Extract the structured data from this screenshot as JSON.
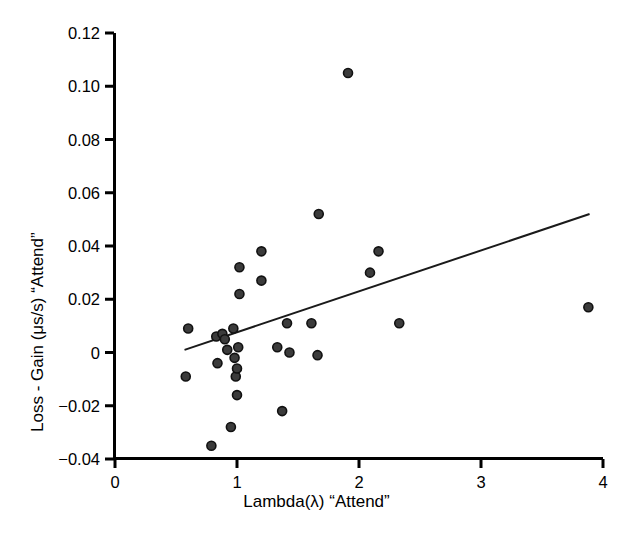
{
  "chart_data": {
    "type": "scatter",
    "title": "",
    "xlabel": "Lambda(λ) “Attend”",
    "ylabel": "Loss - Gain (μs/s) “Attend”",
    "xlim": [
      0,
      4
    ],
    "ylim": [
      -0.04,
      0.12
    ],
    "xticks": [
      0,
      1,
      2,
      3,
      4
    ],
    "xticklabels": [
      "0",
      "1",
      "2",
      "3",
      "4"
    ],
    "yticks": [
      -0.04,
      -0.02,
      0,
      0.02,
      0.04,
      0.06,
      0.08,
      0.1,
      0.12
    ],
    "yticklabels": [
      "−0.04",
      "−0.02",
      "0",
      "0.02",
      "0.04",
      "0.06",
      "0.08",
      "0.10",
      "0.12"
    ],
    "grid": false,
    "legend": null,
    "marker": {
      "shape": "circle",
      "fill_color": "#3b3b3b",
      "edge_color": "#111111",
      "size_px": 9
    },
    "points": [
      {
        "x": 0.58,
        "y": -0.009
      },
      {
        "x": 0.6,
        "y": 0.009
      },
      {
        "x": 0.79,
        "y": -0.035
      },
      {
        "x": 0.83,
        "y": 0.006
      },
      {
        "x": 0.84,
        "y": -0.004
      },
      {
        "x": 0.88,
        "y": 0.007
      },
      {
        "x": 0.9,
        "y": 0.005
      },
      {
        "x": 0.92,
        "y": 0.001
      },
      {
        "x": 0.95,
        "y": -0.028
      },
      {
        "x": 0.97,
        "y": 0.009
      },
      {
        "x": 0.98,
        "y": -0.002
      },
      {
        "x": 0.99,
        "y": -0.009
      },
      {
        "x": 1.0,
        "y": -0.016
      },
      {
        "x": 1.0,
        "y": -0.006
      },
      {
        "x": 1.01,
        "y": 0.002
      },
      {
        "x": 1.02,
        "y": 0.022
      },
      {
        "x": 1.02,
        "y": 0.032
      },
      {
        "x": 1.2,
        "y": 0.027
      },
      {
        "x": 1.2,
        "y": 0.038
      },
      {
        "x": 1.33,
        "y": 0.002
      },
      {
        "x": 1.37,
        "y": -0.022
      },
      {
        "x": 1.41,
        "y": 0.011
      },
      {
        "x": 1.43,
        "y": 0.0
      },
      {
        "x": 1.61,
        "y": 0.011
      },
      {
        "x": 1.66,
        "y": -0.001
      },
      {
        "x": 1.67,
        "y": 0.052
      },
      {
        "x": 1.91,
        "y": 0.105
      },
      {
        "x": 2.09,
        "y": 0.03
      },
      {
        "x": 2.16,
        "y": 0.038
      },
      {
        "x": 2.33,
        "y": 0.011
      },
      {
        "x": 3.88,
        "y": 0.017
      }
    ],
    "trendline": {
      "type": "linear-fit",
      "x_start": 0.57,
      "y_start": 0.001,
      "x_end": 3.89,
      "y_end": 0.052,
      "color": "#1a1a1a",
      "width_px": 2
    }
  }
}
